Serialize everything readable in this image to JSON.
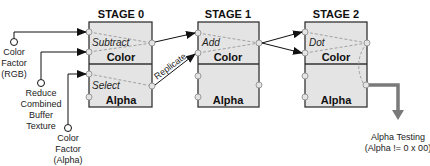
{
  "colors": {
    "box_fill": "#e4e4e4",
    "box_stroke": "#333333",
    "dashed": "#999999",
    "arrow": "#111111",
    "output_arrow": "#7a7a7a"
  },
  "stages": [
    {
      "title": "STAGE  0",
      "color_label": "Color",
      "alpha_label": "Alpha",
      "color_op": "Subtract",
      "alpha_op": "Select"
    },
    {
      "title": "STAGE  1",
      "color_label": "Color",
      "alpha_label": "Alpha",
      "color_op": "Add",
      "alpha_op": ""
    },
    {
      "title": "STAGE  2",
      "color_label": "Color",
      "alpha_label": "Alpha",
      "color_op": "Dot",
      "alpha_op": ""
    }
  ],
  "inputs": [
    {
      "lines": [
        "Color",
        "Factor",
        "(RGB)"
      ]
    },
    {
      "lines": [
        "Reduce",
        "Combined",
        "Buffer",
        "Texture"
      ]
    },
    {
      "lines": [
        "Color",
        "Factor",
        "(Alpha)"
      ]
    }
  ],
  "edges": {
    "replicate_label": "Replicate"
  },
  "output": {
    "lines": [
      "Alpha Testing",
      "(Alpha != 0 x 00)"
    ]
  }
}
